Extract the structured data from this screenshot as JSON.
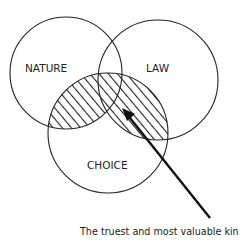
{
  "diagram": {
    "type": "venn",
    "circles": [
      {
        "id": "nature",
        "label": "NATURE",
        "cx": 66,
        "cy": 73,
        "r": 56
      },
      {
        "id": "law",
        "label": "LAW",
        "cx": 158,
        "cy": 80,
        "r": 60
      },
      {
        "id": "choice",
        "label": "CHOICE",
        "cx": 108,
        "cy": 133,
        "r": 60
      }
    ],
    "highlight": {
      "description": "Hatched region: part of CHOICE overlapping NATURE and/or LAW",
      "pattern": "diagonal-hatch"
    },
    "callout": {
      "text": "The truest and most valuable kin",
      "arrow_from": [
        210,
        218
      ],
      "arrow_to": [
        122,
        108
      ]
    },
    "colors": {
      "stroke": "#222222",
      "background": "#ffffff"
    }
  }
}
